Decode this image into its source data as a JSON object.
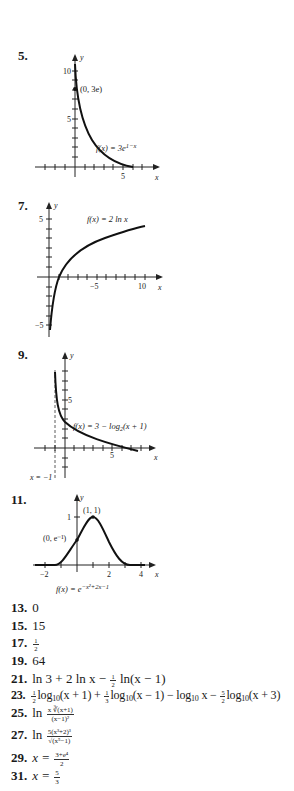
{
  "problems": [
    {
      "number": "5.",
      "graph": {
        "function_label_prefix": "f(x) = 3e",
        "function_label_exp": "1−x",
        "point_label": "(0, 3e)",
        "y_ticks": [
          "10",
          "5"
        ],
        "x_ticks": [
          "5"
        ],
        "x_axis_label": "x",
        "y_axis_label": "y"
      }
    },
    {
      "number": "7.",
      "graph": {
        "function_label": "f(x) = 2 ln x",
        "y_ticks": [
          "5",
          "−5"
        ],
        "x_ticks": [
          "−5",
          "10"
        ],
        "x_axis_label": "x",
        "y_axis_label": "y"
      }
    },
    {
      "number": "9.",
      "graph": {
        "function_label_prefix": "f(x) = 3 − log",
        "function_label_sub": "2",
        "function_label_suffix": "(x + 1)",
        "asymptote_label": "x = −1",
        "y_ticks": [
          "5"
        ],
        "x_ticks": [
          "5"
        ],
        "x_axis_label": "x",
        "y_axis_label": "y"
      }
    },
    {
      "number": "11.",
      "graph": {
        "function_label_prefix": "f(x) = e",
        "function_label_exp": "−x²+2x−1",
        "point_max_label": "(1, 1)",
        "point_intercept_label": "(0, e⁻¹)",
        "y_ticks": [
          "1"
        ],
        "x_ticks": [
          "−2",
          "2",
          "4"
        ],
        "x_axis_label": "x",
        "y_axis_label": "y"
      }
    }
  ],
  "answers": [
    {
      "number": "13.",
      "text": "0"
    },
    {
      "number": "15.",
      "text": "15"
    },
    {
      "number": "17.",
      "frac_num": "1",
      "frac_den": "2"
    },
    {
      "number": "19.",
      "text": "64"
    },
    {
      "number": "21.",
      "part1": "ln 3 + 2 ln x − ",
      "frac_num": "1",
      "frac_den": "2",
      "part2": " ln(x − 1)"
    },
    {
      "number": "23.",
      "terms": [
        {
          "coef_num": "1",
          "coef_den": "2",
          "body": "log",
          "sub": "10",
          "arg": "(x + 1) + "
        },
        {
          "coef_num": "1",
          "coef_den": "3",
          "body": "log",
          "sub": "10",
          "arg": "(x − 1) − log"
        },
        {
          "sub": "10",
          "arg": " x − "
        },
        {
          "coef_num": "5",
          "coef_den": "2",
          "body": "log",
          "sub": "10",
          "arg": "(x + 3)"
        }
      ]
    },
    {
      "number": "25.",
      "prefix": "ln",
      "frac_num": "x ∛(x+1)",
      "frac_den": "(x−1)²"
    },
    {
      "number": "27.",
      "prefix": "ln",
      "frac_num": "5(x³+2)³",
      "frac_den": "√(x⁵−1)"
    },
    {
      "number": "29.",
      "prefix": "x =",
      "frac_num": "3+e⁴",
      "frac_den": "2"
    },
    {
      "number": "31.",
      "prefix": "x =",
      "frac_num": "5",
      "frac_den": "3"
    }
  ]
}
